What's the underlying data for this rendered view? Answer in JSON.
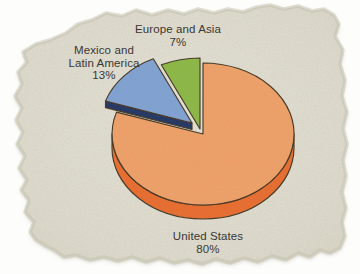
{
  "figure": {
    "paper_color": "#E2DFD0",
    "page_background": "#FDFDFC",
    "text_color": "#3A3733"
  },
  "chart_data": {
    "type": "pie",
    "style": "3d-exploded",
    "title": "",
    "legend": "none",
    "order": "clockwise-from-top",
    "slices": [
      {
        "label": "United States",
        "value_pct": 80,
        "top_color": "#F4A167",
        "side_color": "#ED6B2B",
        "exploded": false
      },
      {
        "label": "Mexico and Latin America",
        "value_pct": 13,
        "top_color": "#7FA3D6",
        "side_color": "#1E3263",
        "exploded": true
      },
      {
        "label": "Europe and Asia",
        "value_pct": 7,
        "top_color": "#8CBA43",
        "exploded": false
      }
    ],
    "outline_color": "#42341F",
    "labels": {
      "europe_asia": {
        "line1": "Europe and Asia",
        "line2": "7%"
      },
      "mexico_latin": {
        "line1": "Mexico and",
        "line2": "Latin America",
        "line3": "13%"
      },
      "united_states": {
        "line1": "United States",
        "line2": "80%"
      }
    }
  }
}
